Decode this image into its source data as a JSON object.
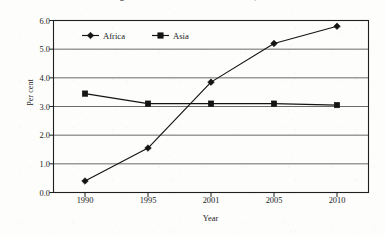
{
  "figure": {
    "caption": "Annex figure I. 17. Share of total FDI inflows, 1990-2010",
    "background_color": "#fdfdfc",
    "ink_color": "#141414"
  },
  "chart_data": {
    "type": "line",
    "title": "",
    "xlabel": "Year",
    "ylabel": "Per cent",
    "categories": [
      "1990",
      "1995",
      "2001",
      "2005",
      "2010"
    ],
    "series": [
      {
        "name": "Africa",
        "marker": "diamond",
        "values": [
          0.4,
          1.55,
          3.85,
          5.2,
          5.8
        ]
      },
      {
        "name": "Asia",
        "marker": "square",
        "values": [
          3.45,
          3.1,
          3.1,
          3.1,
          3.05
        ]
      }
    ],
    "ylim": [
      0.0,
      6.0
    ],
    "ytick_labels": [
      "0.0",
      "1.0",
      "2.0",
      "3.0",
      "4.0",
      "5.0",
      "6.0"
    ],
    "ytick_values": [
      0.0,
      1.0,
      2.0,
      3.0,
      4.0,
      5.0,
      6.0
    ],
    "grid": true,
    "grid_axis": "y",
    "legend_position": "top-center-inside",
    "legend_entries": [
      "Africa",
      "Asia"
    ]
  }
}
